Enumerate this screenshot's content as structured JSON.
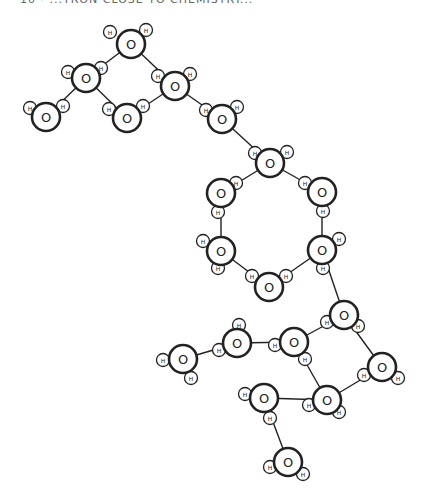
{
  "caption": "10 · ...TRON CLOSE TO CHEMISTRY...",
  "labels": {
    "oxygen": "O",
    "hydrogen": "H"
  },
  "molecules": [
    {
      "o": [
        131,
        44
      ],
      "h": [
        [
          110,
          32
        ],
        [
          146,
          30
        ]
      ]
    },
    {
      "o": [
        86,
        78
      ],
      "h": [
        [
          68,
          72
        ],
        [
          101,
          68
        ]
      ]
    },
    {
      "o": [
        175,
        86
      ],
      "h": [
        [
          158,
          76
        ],
        [
          190,
          74
        ]
      ]
    },
    {
      "o": [
        46,
        117
      ],
      "h": [
        [
          30,
          108
        ],
        [
          63,
          106
        ]
      ]
    },
    {
      "o": [
        127,
        118
      ],
      "h": [
        [
          109,
          109
        ],
        [
          143,
          106
        ]
      ]
    },
    {
      "o": [
        222,
        119
      ],
      "h": [
        [
          206,
          110
        ],
        [
          237,
          107
        ]
      ]
    },
    {
      "o": [
        270,
        163
      ],
      "h": [
        [
          255,
          153
        ],
        [
          287,
          152
        ]
      ]
    },
    {
      "o": [
        221,
        193
      ],
      "h": [
        [
          236,
          183
        ],
        [
          218,
          212
        ]
      ]
    },
    {
      "o": [
        322,
        192
      ],
      "h": [
        [
          305,
          183
        ],
        [
          323,
          211
        ]
      ]
    },
    {
      "o": [
        221,
        251
      ],
      "h": [
        [
          203,
          241
        ],
        [
          218,
          268
        ]
      ]
    },
    {
      "o": [
        322,
        250
      ],
      "h": [
        [
          339,
          239
        ],
        [
          323,
          268
        ]
      ]
    },
    {
      "o": [
        269,
        287
      ],
      "h": [
        [
          252,
          276
        ],
        [
          286,
          276
        ]
      ]
    },
    {
      "o": [
        344,
        315
      ],
      "h": [
        [
          327,
          322
        ],
        [
          358,
          326
        ]
      ]
    },
    {
      "o": [
        237,
        343
      ],
      "h": [
        [
          239,
          325
        ],
        [
          219,
          350
        ]
      ]
    },
    {
      "o": [
        294,
        342
      ],
      "h": [
        [
          275,
          345
        ],
        [
          305,
          359
        ]
      ]
    },
    {
      "o": [
        183,
        359
      ],
      "h": [
        [
          163,
          360
        ],
        [
          191,
          378
        ]
      ]
    },
    {
      "o": [
        382,
        367
      ],
      "h": [
        [
          364,
          375
        ],
        [
          398,
          378
        ]
      ]
    },
    {
      "o": [
        264,
        398
      ],
      "h": [
        [
          245,
          394
        ],
        [
          270,
          418
        ]
      ]
    },
    {
      "o": [
        327,
        400
      ],
      "h": [
        [
          309,
          405
        ],
        [
          339,
          412
        ]
      ]
    },
    {
      "o": [
        288,
        462
      ],
      "h": [
        [
          270,
          467
        ],
        [
          303,
          474
        ]
      ]
    }
  ],
  "bonds": [
    [
      0,
      1
    ],
    [
      0,
      2
    ],
    [
      1,
      3
    ],
    [
      1,
      4
    ],
    [
      4,
      2
    ],
    [
      2,
      5
    ],
    [
      5,
      6
    ],
    [
      6,
      7
    ],
    [
      6,
      8
    ],
    [
      7,
      9
    ],
    [
      8,
      10
    ],
    [
      9,
      11
    ],
    [
      10,
      11
    ],
    [
      10,
      12
    ],
    [
      12,
      14
    ],
    [
      12,
      16
    ],
    [
      14,
      13
    ],
    [
      13,
      15
    ],
    [
      14,
      18
    ],
    [
      16,
      18
    ],
    [
      18,
      17
    ],
    [
      17,
      19
    ]
  ]
}
